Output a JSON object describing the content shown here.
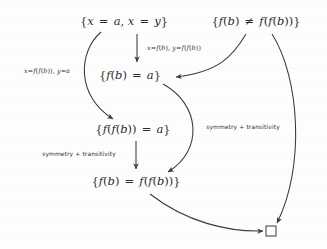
{
  "diagram": {
    "background_color": "#fdfdfd",
    "ink_color": "#2b2b2b",
    "nodes": [
      {
        "id": "n1",
        "label": "{x = a, x = y}",
        "x": 124,
        "y": 22
      },
      {
        "id": "n2",
        "label": "{f(b) ≠ f(f(b))}",
        "x": 256,
        "y": 22
      },
      {
        "id": "n3",
        "label": "{f(b) = a}",
        "x": 130,
        "y": 76
      },
      {
        "id": "n4",
        "label": "{f(f(b)) = a}",
        "x": 133,
        "y": 130
      },
      {
        "id": "n5",
        "label": "{f(b) = f(f(b))}",
        "x": 136,
        "y": 182
      },
      {
        "id": "n6",
        "label": "□",
        "x": 271,
        "y": 231
      }
    ],
    "edge_labels": [
      {
        "id": "e1",
        "text": "x=f(b), y=f(f(b))",
        "x": 174,
        "y": 48,
        "kind": "substitution"
      },
      {
        "id": "e2",
        "text": "x=f(f(b)), y=a",
        "x": 47,
        "y": 71,
        "kind": "substitution"
      },
      {
        "id": "e3",
        "text": "symmetry + transitivity",
        "x": 243,
        "y": 128,
        "kind": "rule"
      },
      {
        "id": "e4",
        "text": "symmetry + transitivity",
        "x": 79,
        "y": 155,
        "kind": "rule"
      }
    ],
    "edges": [
      {
        "from": "n1",
        "to": "n3",
        "style": "straight-down",
        "label": "e1"
      },
      {
        "from": "n1",
        "to": "n4",
        "style": "curve-left-bow",
        "label": "e2"
      },
      {
        "from": "n2",
        "to": "n3",
        "style": "curve-sweep-left"
      },
      {
        "from": "n3",
        "to": "n5",
        "style": "curve-right-bow",
        "label": "e3"
      },
      {
        "from": "n4",
        "to": "n5",
        "style": "straight-down",
        "label": "e4"
      },
      {
        "from": "n2",
        "to": "n6",
        "style": "long-right-arc"
      },
      {
        "from": "n5",
        "to": "n6",
        "style": "curve-down-right"
      }
    ],
    "empty_clause_symbol": "□"
  }
}
